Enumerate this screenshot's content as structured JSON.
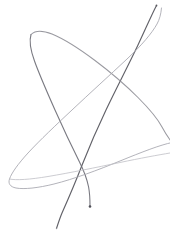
{
  "canvas": {
    "width": 170,
    "height": 244,
    "background_color": "#ffffff",
    "title": "Hand-drawn scribble sketch"
  },
  "drawing": {
    "medium": "pencil-line-sketch",
    "description": "Continuous freehand scribble forming an overlapping star-like loop figure",
    "stroke_count": 5,
    "palette": {
      "darkest": "#595960",
      "dark": "#6e6e76",
      "mid": "#8e8e96",
      "light": "#a8a8b0",
      "lightest": "#bfbfc6"
    },
    "strokes": [
      {
        "name": "descending-dark-diagonal",
        "color": "#595960",
        "width": 1.15,
        "opacity": 0.95,
        "path": "M 156.5 5.5 C 152.0 14.0 146.0 28.0 138.0 45.0 C 128.0 66.0 116.0 89.0 106.0 110.0 C 96.0 131.0 88.0 150.0 82.5 164.0 C 77.5 177.0 70.0 195.0 62.0 213.0 C 59.5 219.0 57.8 224.5 56.5 228.5"
      },
      {
        "name": "left-loop-apex-descender",
        "color": "#6e6e76",
        "width": 1.1,
        "opacity": 0.92,
        "path": "M 31.0 34.5 C 29.0 41.0 30.5 50.0 34.5 61.0 C 39.5 75.0 47.0 92.0 55.0 110.0 C 63.0 128.0 72.0 147.0 79.5 162.0 C 84.0 171.0 87.0 179.0 88.6 187.0 C 89.6 192.5 90.0 199.0 90.0 206.0"
      },
      {
        "name": "upper-loop-right-sweep",
        "color": "#8e8e96",
        "width": 1.05,
        "opacity": 0.9,
        "path": "M 31.0 34.5 C 35.0 30.5 42.0 30.0 52.0 34.0 C 64.0 39.0 79.0 48.5 95.0 60.5 C 111.0 72.5 126.0 85.5 138.0 97.5 C 150.0 109.5 158.0 119.5 162.0 127.0 C 166.0 134.5 170.0 140.0 172.0 142.5"
      },
      {
        "name": "lower-left-rounded-loop",
        "color": "#a8a8b0",
        "width": 1.0,
        "opacity": 0.88,
        "path": "M 172.0 142.5 C 160.0 145.0 142.0 152.0 120.0 161.0 C 98.0 170.0 74.0 179.0 54.0 184.0 C 38.0 188.0 24.0 189.5 16.0 188.0 C 10.0 186.8 8.0 183.5 9.5 179.0 C 11.5 173.0 18.0 164.0 28.0 153.0 C 40.0 140.0 56.0 125.0 72.0 110.0 C 90.0 93.0 110.0 75.0 127.0 59.0 C 142.0 45.0 152.0 33.0 157.0 24.0 C 159.5 19.5 161.0 14.0 161.5 8.0"
      },
      {
        "name": "long-faint-rightward-tail",
        "color": "#bfbfc6",
        "width": 0.95,
        "opacity": 0.85,
        "path": "M 9.5 179.0 C 16.0 180.5 30.0 179.5 48.0 176.5 C 70.0 172.8 96.0 167.5 120.0 162.5 C 140.0 158.3 158.0 155.0 170.0 153.0"
      }
    ],
    "endpoints": [
      {
        "name": "stroke-start-top-right",
        "x": 156.5,
        "y": 5.5,
        "color": "#595960",
        "radius": 0.9
      },
      {
        "name": "stroke-end-bottom-center",
        "x": 90.0,
        "y": 206.5,
        "color": "#4f4f57",
        "radius": 1.3
      },
      {
        "name": "stroke-end-bottom-left",
        "x": 56.5,
        "y": 228.5,
        "color": "#8e8e96",
        "radius": 0.7
      }
    ],
    "crossings": [
      {
        "name": "crossing-upper-middle",
        "x": 88,
        "y": 73
      },
      {
        "name": "crossing-mid-right",
        "x": 124,
        "y": 98
      },
      {
        "name": "crossing-lower-center",
        "x": 84,
        "y": 172
      },
      {
        "name": "loop-apex-top-left",
        "x": 31,
        "y": 34
      },
      {
        "name": "loop-corner-lower-left",
        "x": 10,
        "y": 182
      }
    ]
  }
}
